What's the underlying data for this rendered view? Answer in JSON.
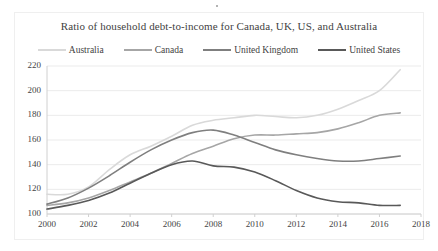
{
  "figure": {
    "title": "Ratio of household debt-to-income for Canada, UK, US, and Australia",
    "border_color": "#efefef",
    "background": "#ffffff"
  },
  "legend": {
    "position": "top",
    "items": [
      {
        "label": "Australia",
        "color": "#d9d9d9"
      },
      {
        "label": "Canada",
        "color": "#a6a6a6"
      },
      {
        "label": "United Kingdom",
        "color": "#7f7f7f"
      },
      {
        "label": "United States",
        "color": "#595959"
      }
    ]
  },
  "axes": {
    "y_ticks": [
      "220",
      "200",
      "180",
      "160",
      "140",
      "120",
      "100"
    ],
    "x_ticks": [
      "2000",
      "2002",
      "2004",
      "2006",
      "2008",
      "2010",
      "2012",
      "2014",
      "2016",
      "2018"
    ],
    "gridline_color": "#ebebeb",
    "axis_color": "#d0d0d0"
  },
  "chart_data": {
    "type": "line",
    "title": "Ratio of household debt-to-income for Canada, UK, US, and Australia",
    "xlabel": "",
    "ylabel": "",
    "xlim": [
      2000,
      2018
    ],
    "ylim": [
      100,
      220
    ],
    "ytick_step": 20,
    "xtick_step": 2,
    "grid": true,
    "legend_position": "top",
    "x": [
      2000,
      2001,
      2002,
      2003,
      2004,
      2005,
      2006,
      2007,
      2008,
      2009,
      2010,
      2011,
      2012,
      2013,
      2014,
      2015,
      2016,
      2017
    ],
    "series": [
      {
        "name": "Australia",
        "color": "#d9d9d9",
        "width": 1.6,
        "values": [
          116,
          116,
          122,
          136,
          148,
          155,
          163,
          172,
          176,
          178,
          180,
          179,
          178,
          180,
          185,
          192,
          200,
          217
        ]
      },
      {
        "name": "Canada",
        "color": "#a6a6a6",
        "width": 1.6,
        "values": [
          107,
          109,
          113,
          119,
          126,
          133,
          141,
          149,
          155,
          161,
          164,
          164,
          165,
          166,
          169,
          174,
          180,
          182
        ]
      },
      {
        "name": "United Kingdom",
        "color": "#7f7f7f",
        "width": 1.6,
        "values": [
          108,
          113,
          121,
          131,
          142,
          152,
          160,
          166,
          168,
          164,
          158,
          152,
          148,
          145,
          143,
          143,
          145,
          147
        ]
      },
      {
        "name": "United States",
        "color": "#595959",
        "width": 1.6,
        "values": [
          104,
          107,
          111,
          117,
          125,
          133,
          140,
          143,
          139,
          138,
          134,
          127,
          119,
          113,
          110,
          109,
          107,
          107
        ]
      }
    ]
  }
}
